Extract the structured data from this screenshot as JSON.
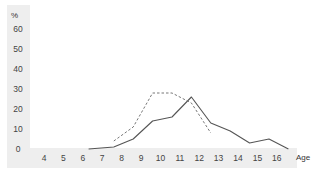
{
  "chart_data": {
    "type": "line",
    "title": "",
    "xlabel": "Age",
    "ylabel": "%",
    "x_ticks": [
      4,
      5,
      6,
      7,
      8,
      9,
      10,
      11,
      12,
      13,
      14,
      15,
      16
    ],
    "y_ticks": [
      0,
      10,
      20,
      30,
      40,
      50,
      60
    ],
    "xlim": [
      3.2,
      17
    ],
    "ylim": [
      0,
      60
    ],
    "grid": false,
    "legend": null,
    "series": [
      {
        "name": "solid",
        "style": "solid",
        "color": "#555555",
        "x": [
          6.3,
          7.6,
          8.6,
          9.6,
          10.6,
          11.6,
          12.6,
          13.6,
          14.6,
          15.6,
          16.6
        ],
        "y": [
          0,
          1,
          5,
          14,
          16,
          26,
          13,
          9,
          3,
          5,
          0
        ]
      },
      {
        "name": "dashed",
        "style": "dashed",
        "color": "#777777",
        "x": [
          7.6,
          8.6,
          9.6,
          10.6,
          11.6,
          12.6
        ],
        "y": [
          4,
          11,
          28,
          28,
          23,
          8
        ]
      }
    ]
  },
  "colors": {
    "axis_band": "#eeeeee",
    "text": "#444444"
  }
}
